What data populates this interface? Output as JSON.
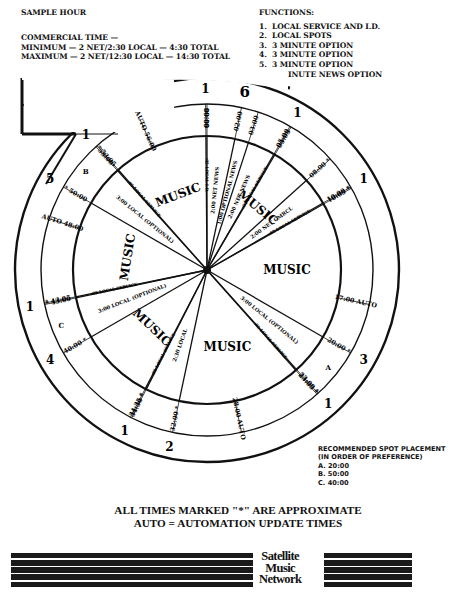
{
  "header": {
    "title_cut": "PRIME HOUR",
    "sample_hour": "SAMPLE HOUR",
    "commercial_time_label": "COMMERCIAL TIME —",
    "minimum": "MINIMUM — 2 NET/2:30 LOCAL — 4:30 TOTAL",
    "maximum": "MAXIMUM — 2 NET/12:30 LOCAL — 14:30 TOTAL"
  },
  "functions": {
    "title": "FUNCTIONS:",
    "items": [
      {
        "n": "1.",
        "label": "LOCAL SERVICE AND I.D."
      },
      {
        "n": "2.",
        "label": "LOCAL SPOTS"
      },
      {
        "n": "3.",
        "label": "3 MINUTE OPTION"
      },
      {
        "n": "4.",
        "label": "3 MINUTE OPTION"
      },
      {
        "n": "5.",
        "label": "3 MINUTE OPTION"
      },
      {
        "n": "6.",
        "label": "1 MINUTE NEWS OPTION"
      }
    ]
  },
  "legend_box": {
    "functions_label": "FUNCTIONS",
    "time_label": "TIME"
  },
  "clock": {
    "time_marks": [
      {
        "time": "AUTO 56:00",
        "minute": 56
      },
      {
        "time": "59:55",
        "minute": 59.92
      },
      {
        "time": "00:00",
        "minute": 0
      },
      {
        "time": "02:00",
        "minute": 2
      },
      {
        "time": "03:00",
        "minute": 3
      },
      {
        "time": "05:00",
        "minute": 5
      },
      {
        "time": "05:05",
        "minute": 5.08
      },
      {
        "time": "08:00 *",
        "minute": 8
      },
      {
        "time": "10:00 *",
        "minute": 10
      },
      {
        "time": "10:05 *",
        "minute": 10.08
      },
      {
        "time": "17:00 AUTO",
        "minute": 17
      },
      {
        "time": "20:00 *",
        "minute": 20
      },
      {
        "time": "23:00 *",
        "minute": 23
      },
      {
        "time": "23:05 *",
        "minute": 23.08
      },
      {
        "time": "28:00 AUTO",
        "minute": 28
      },
      {
        "time": "32:00 *",
        "minute": 32
      },
      {
        "time": "34:30 *",
        "minute": 34.5
      },
      {
        "time": "34:35 *",
        "minute": 34.58
      },
      {
        "time": "40:00 *",
        "minute": 40
      },
      {
        "time": "* 43:00",
        "minute": 43
      },
      {
        "time": "* 43:05",
        "minute": 43.08
      },
      {
        "time": "AUTO 48:00",
        "minute": 48
      },
      {
        "time": "* 50:00",
        "minute": 50
      },
      {
        "time": "53:00",
        "minute": 53
      },
      {
        "time": "* 53:05",
        "minute": 53.08
      }
    ],
    "function_numbers": [
      {
        "n": "1",
        "minute": 59.92
      },
      {
        "n": "6",
        "minute": 2
      },
      {
        "n": "1",
        "minute": 5
      },
      {
        "n": "1",
        "minute": 10
      },
      {
        "n": "3",
        "minute": 20
      },
      {
        "n": "1",
        "minute": 23
      },
      {
        "n": "2",
        "minute": 32
      },
      {
        "n": "1",
        "minute": 34.5
      },
      {
        "n": "4",
        "minute": 40
      },
      {
        "n": "1",
        "minute": 43
      },
      {
        "n": "5",
        "minute": 50
      },
      {
        "n": "1",
        "minute": 53
      }
    ],
    "segments": [
      {
        "label": ":05 LOCAL I.D.",
        "start": 59.92,
        "end": 0
      },
      {
        "label": "2:00 NET NEWS",
        "start": 0,
        "end": 2
      },
      {
        "label": "1:00 OPTIONAL NEWS",
        "start": 2,
        "end": 3
      },
      {
        "label": "2:00 NET NEWS",
        "start": 3,
        "end": 5
      },
      {
        "label": ":05 LOCAL SERVICE",
        "start": 5,
        "end": 5.08
      },
      {
        "label": "MUSIC",
        "start": 5.08,
        "end": 8
      },
      {
        "label": "2:00 NET CMRCL",
        "start": 8,
        "end": 10
      },
      {
        "label": ":05 LOCAL SERVICE",
        "start": 10,
        "end": 10.08
      },
      {
        "label": "MUSIC",
        "start": 10.08,
        "end": 20
      },
      {
        "label": "3:00 LOCAL (OPTIONAL)",
        "start": 20,
        "end": 23
      },
      {
        "label": ":05 LOCAL SERVICE",
        "start": 23,
        "end": 23.08
      },
      {
        "label": "MUSIC",
        "start": 23.08,
        "end": 32
      },
      {
        "label": "2:30 LOCAL",
        "start": 32,
        "end": 34.5
      },
      {
        "label": ":05 LOCAL SERVICE",
        "start": 34.5,
        "end": 34.58
      },
      {
        "label": "MUSIC",
        "start": 34.58,
        "end": 40
      },
      {
        "label": "3:00 LOCAL (OPTIONAL)",
        "start": 40,
        "end": 43
      },
      {
        "label": ":05 LOCAL SERVICE",
        "start": 43,
        "end": 43.08
      },
      {
        "label": "MUSIC",
        "start": 43.08,
        "end": 50
      },
      {
        "label": "3:00 LOCAL (OPTIONAL)",
        "start": 50,
        "end": 53
      },
      {
        "label": ":05 LOCAL SERVICE",
        "start": 53,
        "end": 53.08
      },
      {
        "label": "MUSIC",
        "start": 53.08,
        "end": 59.92
      }
    ],
    "spot_letters": [
      {
        "letter": "A",
        "minute": 21.5
      },
      {
        "letter": "B",
        "minute": 51.5
      },
      {
        "letter": "C",
        "minute": 41.5
      }
    ]
  },
  "recommended": {
    "title": "RECOMMENDED SPOT PLACEMENT",
    "subtitle": "(IN ORDER OF PREFERENCE)",
    "items": [
      "A. 20:00",
      "B. 50:00",
      "C. 40:00"
    ]
  },
  "footer": {
    "line1": "ALL TIMES MARKED \"*\" ARE APPROXIMATE",
    "line2": "AUTO = AUTOMATION UPDATE TIMES"
  },
  "logo": {
    "line1": "Satellite",
    "line2": "Music",
    "line3": "Network"
  }
}
